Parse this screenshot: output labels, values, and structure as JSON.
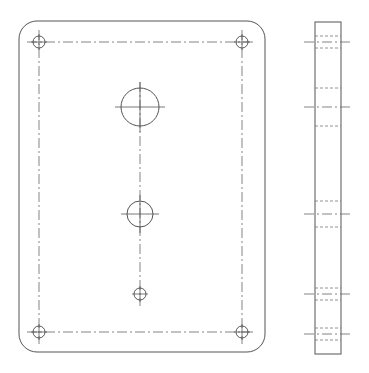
{
  "drawing": {
    "type": "orthographic-plate",
    "colors": {
      "line": "#555555",
      "background": "#ffffff"
    },
    "front_view": {
      "plate": {
        "x": 19,
        "y": 21,
        "width": 246,
        "height": 331,
        "radius": 18
      },
      "bolt_pattern": {
        "x1": 39,
        "x2": 242,
        "y1": 42,
        "y2": 332
      },
      "corner_holes": [
        {
          "cx": 39,
          "cy": 42,
          "r": 6
        },
        {
          "cx": 242,
          "cy": 42,
          "r": 6
        },
        {
          "cx": 39,
          "cy": 332,
          "r": 6
        },
        {
          "cx": 242,
          "cy": 332,
          "r": 6
        }
      ],
      "center_holes": [
        {
          "cx": 140,
          "cy": 107,
          "r": 19
        },
        {
          "cx": 140,
          "cy": 214,
          "r": 13
        },
        {
          "cx": 140,
          "cy": 294,
          "r": 6
        }
      ]
    },
    "side_view": {
      "body": {
        "x": 315,
        "y": 22,
        "width": 26,
        "height": 332
      },
      "holes": [
        {
          "cy": 42,
          "r": 6
        },
        {
          "cy": 107,
          "r": 19
        },
        {
          "cy": 214,
          "r": 13
        },
        {
          "cy": 294,
          "r": 6
        },
        {
          "cy": 334,
          "r": 6
        }
      ]
    }
  }
}
